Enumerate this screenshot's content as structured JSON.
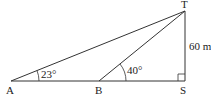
{
  "diagram": {
    "type": "trigonometry-triangle",
    "points": {
      "A": {
        "label": "A",
        "x": 11,
        "y": 81
      },
      "B": {
        "label": "B",
        "x": 99,
        "y": 81
      },
      "S": {
        "label": "S",
        "x": 185,
        "y": 81
      },
      "T": {
        "label": "T",
        "x": 185,
        "y": 11
      }
    },
    "angles": {
      "at_A": "23°",
      "at_B": "40°"
    },
    "side_labels": {
      "TS": "60 m"
    },
    "right_angle_at": "S",
    "colors": {
      "line": "#333333",
      "text": "#222222",
      "background": "#ffffff"
    }
  }
}
